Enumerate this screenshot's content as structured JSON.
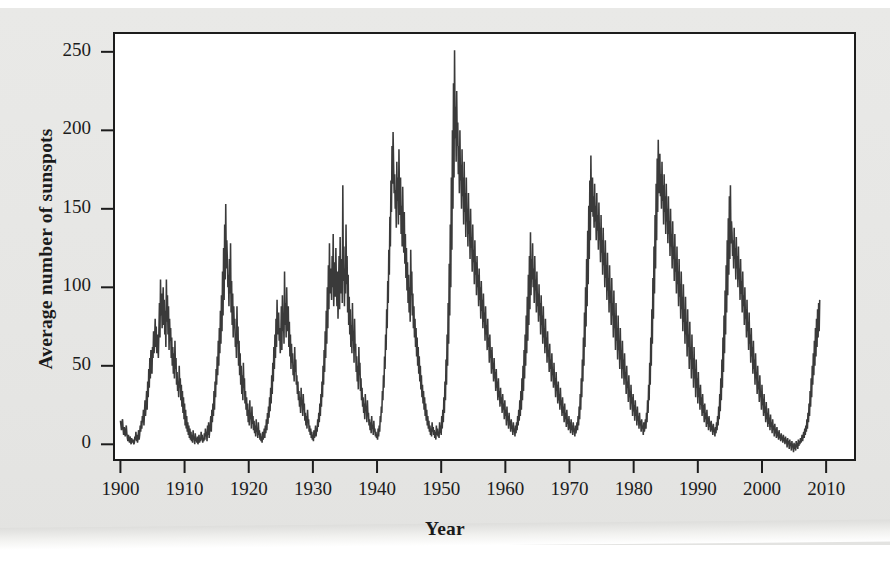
{
  "figure": {
    "background_color": "#e8e8e6",
    "plot_background_color": "#ffffff",
    "line_color": "#3a3a3a",
    "axis_color": "#1c1c1c"
  },
  "axes": {
    "x_label": "Year",
    "y_label": "Average number of sunspots",
    "x_ticks": [
      "1900",
      "1910",
      "1920",
      "1930",
      "1940",
      "1950",
      "1960",
      "1970",
      "1980",
      "1990",
      "2000",
      "2010"
    ],
    "y_ticks": [
      "0",
      "50",
      "100",
      "150",
      "200",
      "250"
    ]
  },
  "chart_data": {
    "type": "line",
    "title": "",
    "subtitle": "",
    "xlabel": "Year",
    "ylabel": "Average number of sunspots",
    "xlim": [
      1899.0,
      2014.5
    ],
    "ylim": [
      -10,
      262
    ],
    "x_ticks": [
      1900,
      1910,
      1920,
      1930,
      1940,
      1950,
      1960,
      1970,
      1980,
      1990,
      2000,
      2010
    ],
    "y_ticks": [
      0,
      50,
      100,
      150,
      200,
      250
    ],
    "grid": false,
    "legend": null,
    "annotations": [],
    "series": [
      {
        "name": "Average number of sunspots",
        "x_start": 1900.0,
        "x_step": 0.0833333,
        "note": "monthly mean sunspot number, 1900.0 through mid-2014",
        "values": [
          15,
          12,
          9,
          14,
          16,
          10,
          6,
          11,
          8,
          5,
          9,
          12,
          7,
          4,
          2,
          6,
          3,
          1,
          5,
          2,
          0,
          4,
          1,
          3,
          2,
          0,
          1,
          5,
          3,
          8,
          2,
          6,
          1,
          4,
          9,
          3,
          6,
          12,
          8,
          15,
          10,
          18,
          14,
          22,
          12,
          20,
          28,
          18,
          26,
          34,
          22,
          40,
          30,
          48,
          36,
          55,
          42,
          60,
          50,
          45,
          62,
          55,
          72,
          58,
          66,
          80,
          62,
          75,
          58,
          70,
          63,
          55,
          72,
          90,
          68,
          105,
          82,
          96,
          74,
          88,
          100,
          76,
          92,
          70,
          85,
          62,
          105,
          78,
          95,
          70,
          88,
          60,
          80,
          66,
          74,
          55,
          68,
          50,
          62,
          45,
          58,
          42,
          66,
          48,
          55,
          38,
          46,
          34,
          40,
          30,
          50,
          36,
          42,
          28,
          38,
          24,
          34,
          20,
          30,
          16,
          26,
          12,
          22,
          10,
          18,
          8,
          14,
          6,
          12,
          4,
          10,
          3,
          8,
          2,
          6,
          1,
          9,
          3,
          5,
          0,
          7,
          2,
          4,
          1,
          5,
          0,
          3,
          6,
          1,
          4,
          2,
          8,
          3,
          6,
          1,
          4,
          2,
          7,
          3,
          10,
          5,
          8,
          2,
          12,
          6,
          14,
          4,
          9,
          11,
          18,
          8,
          22,
          14,
          26,
          18,
          34,
          22,
          40,
          30,
          48,
          38,
          56,
          44,
          66,
          50,
          74,
          58,
          85,
          64,
          95,
          72,
          110,
          82,
          125,
          92,
          140,
          105,
          153,
          112,
          130,
          118,
          100,
          108,
          88,
          118,
          96,
          128,
          84,
          104,
          76,
          96,
          68,
          88,
          74,
          80,
          62,
          70,
          55,
          88,
          64,
          75,
          50,
          66,
          44,
          58,
          38,
          50,
          32,
          44,
          28,
          52,
          36,
          42,
          26,
          34,
          22,
          30,
          18,
          26,
          14,
          22,
          12,
          28,
          16,
          20,
          10,
          24,
          13,
          18,
          9,
          15,
          7,
          12,
          5,
          16,
          8,
          10,
          4,
          14,
          6,
          9,
          3,
          7,
          2,
          5,
          1,
          8,
          3,
          6,
          10,
          4,
          12,
          7,
          16,
          9,
          20,
          13,
          24,
          17,
          30,
          21,
          36,
          26,
          44,
          32,
          52,
          40,
          62,
          48,
          70,
          55,
          80,
          62,
          92,
          70,
          78,
          84,
          66,
          74,
          58,
          68,
          88,
          60,
          95,
          72,
          82,
          64,
          110,
          76,
          90,
          68,
          100,
          80,
          72,
          88,
          62,
          78,
          56,
          70,
          48,
          64,
          52,
          58,
          44,
          50,
          40,
          62,
          46,
          54,
          38,
          44,
          32,
          40,
          28,
          34,
          24,
          30,
          20,
          36,
          26,
          28,
          18,
          32,
          22,
          26,
          15,
          20,
          12,
          18,
          10,
          22,
          14,
          16,
          8,
          12,
          6,
          10,
          4,
          8,
          3,
          6,
          2,
          9,
          4,
          7,
          12,
          5,
          10,
          8,
          16,
          11,
          20,
          14,
          26,
          18,
          32,
          24,
          40,
          30,
          50,
          38,
          60,
          46,
          72,
          55,
          85,
          64,
          100,
          74,
          114,
          86,
          128,
          96,
          112,
          104,
          92,
          120,
          100,
          134,
          88,
          108,
          116,
          94,
          125,
          102,
          88,
          110,
          80,
          100,
          120,
          86,
          132,
          96,
          110,
          118,
          90,
          165,
          104,
          126,
          88,
          112,
          96,
          140,
          102,
          120,
          84,
          108,
          76,
          94,
          70,
          86,
          62,
          76,
          58,
          90,
          66,
          72,
          52,
          80,
          60,
          64,
          46,
          56,
          40,
          50,
          35,
          62,
          44,
          52,
          34,
          42,
          28,
          36,
          24,
          30,
          20,
          26,
          16,
          32,
          22,
          24,
          14,
          28,
          18,
          20,
          12,
          16,
          9,
          14,
          7,
          18,
          10,
          12,
          6,
          15,
          8,
          10,
          5,
          8,
          4,
          6,
          3,
          10,
          5,
          12,
          8,
          18,
          14,
          24,
          20,
          34,
          28,
          44,
          36,
          56,
          48,
          70,
          60,
          86,
          74,
          104,
          90,
          124,
          108,
          145,
          126,
          168,
          148,
          190,
          166,
          199,
          178,
          160,
          172,
          150,
          162,
          138,
          180,
          155,
          170,
          140,
          188,
          158,
          146,
          170,
          134,
          152,
          126,
          164,
          138,
          122,
          148,
          115,
          134,
          106,
          125,
          98,
          116,
          90,
          108,
          84,
          100,
          78,
          124,
          95,
          110,
          82,
          96,
          74,
          88,
          68,
          80,
          62,
          74,
          56,
          68,
          50,
          62,
          45,
          56,
          40,
          50,
          35,
          44,
          30,
          38,
          26,
          34,
          22,
          30,
          18,
          26,
          15,
          22,
          12,
          18,
          10,
          15,
          8,
          12,
          6,
          10,
          5,
          14,
          8,
          11,
          6,
          9,
          4,
          8,
          3,
          12,
          6,
          10,
          5,
          8,
          4,
          14,
          7,
          12,
          6,
          18,
          10,
          22,
          14,
          30,
          20,
          40,
          28,
          54,
          38,
          70,
          50,
          90,
          64,
          115,
          82,
          140,
          100,
          170,
          124,
          200,
          150,
          230,
          170,
          251,
          195,
          215,
          180,
          225,
          190,
          205,
          172,
          190,
          160,
          200,
          168,
          178,
          150,
          188,
          158,
          170,
          140,
          180,
          148,
          160,
          132,
          170,
          142,
          150,
          126,
          160,
          134,
          142,
          118,
          150,
          125,
          132,
          110,
          140,
          116,
          124,
          102,
          130,
          108,
          116,
          95,
          120,
          100,
          108,
          88,
          112,
          92,
          100,
          80,
          104,
          85,
          92,
          74,
          96,
          78,
          84,
          66,
          88,
          70,
          76,
          60,
          80,
          62,
          68,
          52,
          70,
          55,
          60,
          45,
          62,
          48,
          52,
          40,
          55,
          42,
          46,
          34,
          48,
          36,
          40,
          28,
          42,
          30,
          34,
          24,
          36,
          26,
          30,
          20,
          32,
          22,
          26,
          16,
          28,
          18,
          22,
          12,
          24,
          15,
          18,
          10,
          20,
          12,
          15,
          8,
          16,
          10,
          12,
          6,
          14,
          8,
          10,
          5,
          12,
          7,
          14,
          9,
          18,
          12,
          22,
          15,
          28,
          18,
          34,
          22,
          42,
          28,
          50,
          34,
          60,
          42,
          70,
          50,
          82,
          58,
          94,
          66,
          108,
          76,
          120,
          86,
          135,
          95,
          118,
          105,
          128,
          100,
          112,
          90,
          120,
          98,
          105,
          84,
          110,
          88,
          96,
          78,
          102,
          82,
          90,
          70,
          95,
          76,
          82,
          64,
          88,
          68,
          74,
          58,
          80,
          62,
          68,
          52,
          72,
          56,
          60,
          46,
          64,
          48,
          54,
          40,
          58,
          44,
          48,
          36,
          52,
          38,
          42,
          30,
          46,
          34,
          38,
          26,
          40,
          28,
          32,
          22,
          36,
          25,
          28,
          18,
          30,
          20,
          24,
          14,
          26,
          16,
          20,
          11,
          22,
          13,
          16,
          9,
          18,
          10,
          14,
          7,
          16,
          9,
          12,
          6,
          14,
          8,
          10,
          5,
          12,
          7,
          10,
          14,
          9,
          18,
          12,
          24,
          16,
          32,
          22,
          42,
          30,
          54,
          40,
          68,
          50,
          84,
          62,
          100,
          75,
          118,
          88,
          136,
          102,
          152,
          118,
          168,
          130,
          184,
          148,
          162,
          170,
          145,
          158,
          138,
          166,
          142,
          152,
          130,
          160,
          136,
          146,
          124,
          154,
          130,
          138,
          116,
          146,
          122,
          130,
          108,
          138,
          114,
          122,
          100,
          130,
          106,
          114,
          92,
          122,
          98,
          106,
          84,
          114,
          90,
          98,
          76,
          106,
          82,
          90,
          68,
          98,
          74,
          82,
          60,
          90,
          66,
          74,
          54,
          82,
          60,
          66,
          48,
          74,
          54,
          60,
          42,
          66,
          48,
          54,
          38,
          58,
          42,
          46,
          32,
          50,
          36,
          40,
          27,
          44,
          30,
          34,
          22,
          38,
          26,
          30,
          18,
          32,
          21,
          25,
          15,
          28,
          18,
          22,
          12,
          24,
          15,
          18,
          10,
          20,
          12,
          15,
          8,
          16,
          10,
          12,
          6,
          14,
          8,
          11,
          16,
          10,
          20,
          14,
          28,
          20,
          38,
          28,
          52,
          38,
          68,
          50,
          86,
          64,
          106,
          80,
          126,
          96,
          146,
          112,
          166,
          130,
          182,
          148,
          194,
          160,
          175,
          185,
          158,
          172,
          150,
          180,
          155,
          165,
          140,
          172,
          148,
          158,
          134,
          166,
          142,
          150,
          128,
          158,
          134,
          142,
          120,
          150,
          126,
          134,
          112,
          142,
          118,
          126,
          104,
          134,
          110,
          118,
          96,
          126,
          102,
          110,
          88,
          118,
          94,
          102,
          80,
          110,
          86,
          94,
          72,
          102,
          78,
          86,
          64,
          94,
          70,
          78,
          56,
          86,
          62,
          70,
          48,
          78,
          54,
          62,
          42,
          70,
          48,
          55,
          36,
          62,
          42,
          48,
          30,
          54,
          36,
          42,
          26,
          46,
          30,
          36,
          22,
          38,
          25,
          30,
          18,
          32,
          20,
          25,
          14,
          26,
          16,
          20,
          11,
          22,
          13,
          17,
          9,
          18,
          11,
          14,
          8,
          15,
          9,
          12,
          6,
          13,
          8,
          10,
          5,
          11,
          7,
          14,
          9,
          18,
          12,
          24,
          16,
          32,
          21,
          42,
          28,
          54,
          36,
          68,
          46,
          82,
          58,
          98,
          70,
          114,
          84,
          130,
          95,
          144,
          108,
          158,
          118,
          165,
          128,
          142,
          135,
          120,
          130,
          112,
          138,
          118,
          125,
          105,
          132,
          112,
          120,
          100,
          126,
          105,
          112,
          92,
          118,
          96,
          104,
          84,
          110,
          88,
          95,
          76,
          100,
          80,
          86,
          68,
          92,
          72,
          78,
          60,
          84,
          64,
          70,
          52,
          74,
          56,
          62,
          45,
          66,
          48,
          54,
          38,
          58,
          42,
          46,
          32,
          50,
          35,
          40,
          27,
          44,
          30,
          34,
          22,
          38,
          25,
          29,
          18,
          32,
          20,
          24,
          14,
          27,
          16,
          20,
          11,
          23,
          13,
          17,
          9,
          19,
          11,
          14,
          7,
          16,
          9,
          12,
          5,
          13,
          7,
          10,
          4,
          11,
          5,
          8,
          3,
          9,
          4,
          6,
          2,
          7,
          3,
          5,
          1,
          6,
          2,
          4,
          0,
          5,
          1,
          3,
          -2,
          4,
          0,
          2,
          -3,
          3,
          -1,
          1,
          -4,
          2,
          -2,
          0,
          -5,
          1,
          -3,
          0,
          -4,
          2,
          -2,
          1,
          -3,
          3,
          -1,
          2,
          0,
          4,
          1,
          3,
          6,
          2,
          5,
          8,
          4,
          10,
          6,
          12,
          8,
          16,
          10,
          20,
          14,
          26,
          18,
          34,
          24,
          42,
          30,
          50,
          38,
          58,
          44,
          66,
          50,
          74,
          56,
          80,
          62,
          86,
          68,
          90,
          72,
          92
        ]
      }
    ]
  }
}
